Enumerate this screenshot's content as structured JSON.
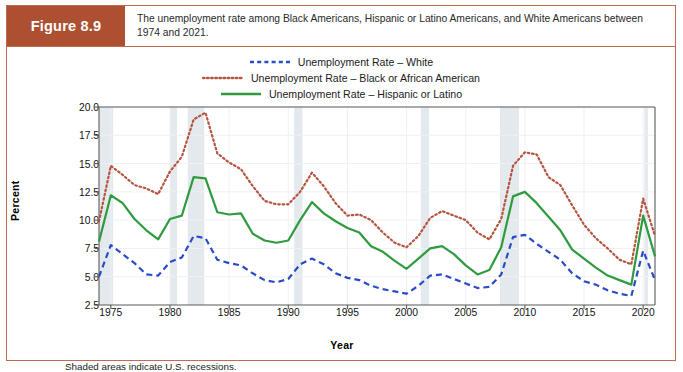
{
  "figure": {
    "badge_label": "Figure 8.9",
    "caption": "The unemployment rate among Black Americans, Hispanic or Latino Americans, and White Americans between 1974 and 2021.",
    "footnote": "Shaded areas indicate U.S. recessions."
  },
  "colors": {
    "badge_bg": "#ad4f31",
    "card_border": "#c06a52",
    "white_series": "#2a4bc7",
    "black_series": "#b5553f",
    "hispanic_series": "#2e9b3e",
    "recession_band": "#e4e9ee",
    "grid": "#eef1f4",
    "axis": "#5a5a5a"
  },
  "chart_data": {
    "type": "line",
    "title": "",
    "xlabel": "Year",
    "ylabel": "Percent",
    "xlim": [
      1974,
      2021
    ],
    "ylim": [
      2.5,
      20.0
    ],
    "xticks": [
      1975,
      1980,
      1985,
      1990,
      1995,
      2000,
      2005,
      2010,
      2015,
      2020
    ],
    "yticks": [
      2.5,
      5.0,
      7.5,
      10.0,
      12.5,
      15.0,
      17.5,
      20.0
    ],
    "grid": true,
    "legend_position": "top-center",
    "annotations": [
      "Shaded areas indicate U.S. recessions."
    ],
    "x": [
      1974,
      1975,
      1976,
      1977,
      1978,
      1979,
      1980,
      1981,
      1982,
      1983,
      1984,
      1985,
      1986,
      1987,
      1988,
      1989,
      1990,
      1991,
      1992,
      1993,
      1994,
      1995,
      1996,
      1997,
      1998,
      1999,
      2000,
      2001,
      2002,
      2003,
      2004,
      2005,
      2006,
      2007,
      2008,
      2009,
      2010,
      2011,
      2012,
      2013,
      2014,
      2015,
      2016,
      2017,
      2018,
      2019,
      2020,
      2021
    ],
    "series": [
      {
        "name": "Unemployment Rate – White",
        "color": "#2a4bc7",
        "style": "dashed",
        "values": [
          5.0,
          7.8,
          7.0,
          6.2,
          5.2,
          5.1,
          6.3,
          6.7,
          8.6,
          8.4,
          6.5,
          6.2,
          6.0,
          5.3,
          4.7,
          4.5,
          4.8,
          6.1,
          6.6,
          6.1,
          5.3,
          4.9,
          4.7,
          4.2,
          3.9,
          3.7,
          3.5,
          4.2,
          5.1,
          5.2,
          4.8,
          4.4,
          4.0,
          4.1,
          5.2,
          8.5,
          8.7,
          7.9,
          7.2,
          6.5,
          5.3,
          4.6,
          4.3,
          3.8,
          3.5,
          3.3,
          7.3,
          4.7
        ]
      },
      {
        "name": "Unemployment Rate – Black or African American",
        "color": "#b5553f",
        "style": "dotted",
        "values": [
          9.9,
          14.8,
          14.0,
          13.1,
          12.8,
          12.3,
          14.3,
          15.6,
          18.9,
          19.5,
          15.9,
          15.1,
          14.5,
          13.0,
          11.7,
          11.4,
          11.4,
          12.5,
          14.2,
          13.0,
          11.5,
          10.4,
          10.5,
          10.0,
          8.9,
          8.0,
          7.6,
          8.6,
          10.2,
          10.8,
          10.4,
          10.0,
          8.9,
          8.3,
          10.1,
          14.8,
          16.0,
          15.8,
          13.8,
          13.1,
          11.3,
          9.6,
          8.4,
          7.5,
          6.5,
          6.1,
          11.9,
          8.6
        ]
      },
      {
        "name": "Unemployment Rate – Hispanic or Latino",
        "color": "#2e9b3e",
        "style": "solid",
        "values": [
          8.1,
          12.2,
          11.5,
          10.1,
          9.1,
          8.3,
          10.1,
          10.4,
          13.8,
          13.7,
          10.7,
          10.5,
          10.6,
          8.8,
          8.2,
          8.0,
          8.2,
          10.0,
          11.6,
          10.6,
          9.9,
          9.3,
          8.9,
          7.7,
          7.2,
          6.4,
          5.7,
          6.6,
          7.5,
          7.7,
          7.0,
          6.0,
          5.2,
          5.6,
          7.6,
          12.1,
          12.5,
          11.5,
          10.3,
          9.1,
          7.4,
          6.6,
          5.8,
          5.1,
          4.7,
          4.3,
          10.4,
          6.8
        ]
      }
    ],
    "recessions": [
      {
        "start": 1974.0,
        "end": 1975.2
      },
      {
        "start": 1980.0,
        "end": 1980.6
      },
      {
        "start": 1981.5,
        "end": 1982.9
      },
      {
        "start": 1990.5,
        "end": 1991.2
      },
      {
        "start": 2001.2,
        "end": 2001.9
      },
      {
        "start": 2007.9,
        "end": 2009.5
      },
      {
        "start": 2020.1,
        "end": 2020.4
      }
    ]
  }
}
